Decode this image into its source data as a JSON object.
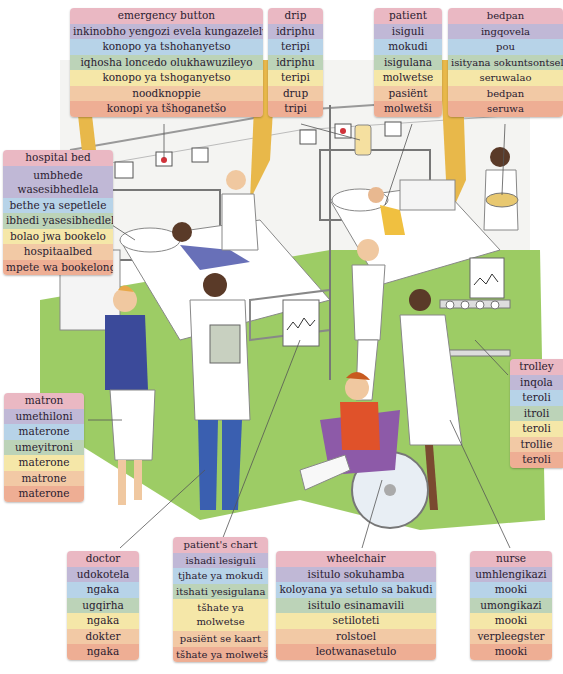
{
  "illustration": {
    "description": "hospital ward scene",
    "colors": {
      "floor": "#8cc34a",
      "wall": "#f2f2f2",
      "curtain": "#e8b84a",
      "matron_cardigan": "#3b4a9a",
      "doctor_trousers": "#3a5fb0",
      "boy_clothes": "#e0522a",
      "wheelchair": "#8d5aa8"
    }
  },
  "row_colors": [
    "#eab8c3",
    "#c0b8d6",
    "#b7d3e8",
    "#bcd3b8",
    "#f5e7a8",
    "#f2c9a5",
    "#eeae94"
  ],
  "labels": {
    "emergency_button": [
      "emergency button",
      "inkinobho yengozi evela kungazelelwe",
      "konopo ya tshohanyetso",
      "iqhosha loncedo olukhawuzileyo",
      "konopo ya tshoganyetso",
      "noodknoppie",
      "konopi ya tšhoganetšo"
    ],
    "drip": [
      "drip",
      "idriphu",
      "teripi",
      "idriphu",
      "teripi",
      "drup",
      "tripi"
    ],
    "patient": [
      "patient",
      "isiguli",
      "mokudi",
      "isigulana",
      "molwetse",
      "pasiënt",
      "molwetši"
    ],
    "bedpan": [
      "bedpan",
      "ingqovela",
      "pou",
      "isityana sokuntsontsela",
      "seruwalao",
      "bedpan",
      "seruwa"
    ],
    "hospital_bed": [
      "hospital bed",
      "umbhede wasesibhedlela",
      "bethe ya sepetlele",
      "ibhedi yasesibhedlele",
      "bolao jwa bookelo",
      "hospitaalbed",
      "mpete wa bookelong"
    ],
    "matron": [
      "matron",
      "umethiloni",
      "materone",
      "umeyitroni",
      "materone",
      "matrone",
      "materone"
    ],
    "trolley": [
      "trolley",
      "inqola",
      "teroli",
      "itroli",
      "teroli",
      "trollie",
      "teroli"
    ],
    "doctor": [
      "doctor",
      "udokotela",
      "ngaka",
      "ugqirha",
      "ngaka",
      "dokter",
      "ngaka"
    ],
    "patients_chart": [
      "patient's chart",
      "ishadi lesiguli",
      "tjhate ya mokudi",
      "itshati yesigulana",
      "tšhate ya molwetse",
      "pasiënt se kaart",
      "tšhate ya molwetši"
    ],
    "wheelchair": [
      "wheelchair",
      "isitulo sokuhamba",
      "koloyana ya setulo sa bakudi",
      "isitulo esinamavili",
      "setiloteti",
      "rolstoel",
      "leotwanasetulo"
    ],
    "nurse": [
      "nurse",
      "umhlengikazi",
      "mooki",
      "umongikazi",
      "mooki",
      "verpleegster",
      "mooki"
    ]
  }
}
